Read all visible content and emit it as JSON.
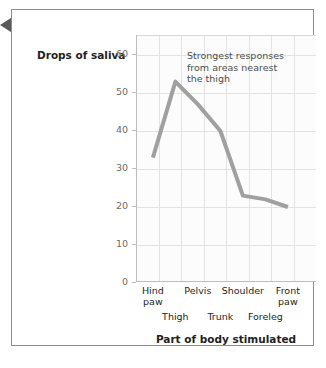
{
  "marker": {
    "icon": "left-triangle-marker",
    "color": "#595959"
  },
  "chart_data": {
    "type": "line",
    "title": "",
    "xlabel": "Part of body stimulated",
    "ylabel": "Drops of saliva",
    "ylim": [
      0,
      65
    ],
    "yticks": [
      0,
      10,
      20,
      30,
      40,
      50,
      60
    ],
    "ytick_labels": [
      "0",
      "10",
      "20",
      "30",
      "40",
      "50",
      "60"
    ],
    "grid": true,
    "legend": "none",
    "line_color": "#a0a0a0",
    "line_width": 4,
    "categories": [
      "Hind paw",
      "Thigh",
      "Pelvis",
      "Trunk",
      "Shoulder",
      "Foreleg",
      "Front paw"
    ],
    "x_labels_row1": [
      "Hind paw",
      "Pelvis",
      "Shoulder",
      "Front paw"
    ],
    "x_labels_row2": [
      "Thigh",
      "Trunk",
      "Foreleg"
    ],
    "values": [
      33,
      53,
      47,
      40,
      23,
      22,
      20
    ],
    "annotations": [
      {
        "text": "Strongest responses from areas nearest the thigh",
        "lines": [
          "Strongest responses",
          "from areas nearest",
          "the thigh"
        ]
      }
    ]
  },
  "axis": {
    "y_title": "Drops of saliva",
    "x_title": "Part of body stimulated"
  }
}
